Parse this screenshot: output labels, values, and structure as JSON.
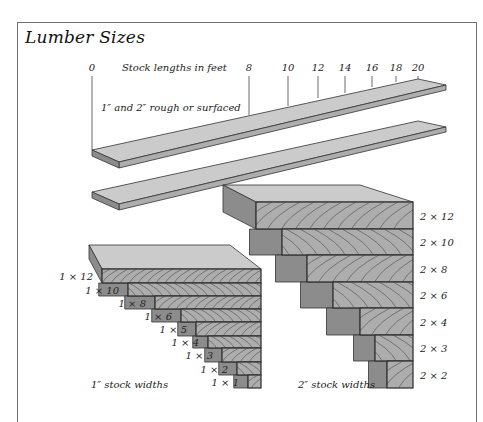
{
  "title": "Lumber Sizes",
  "lengths": {
    "heading": "Stock lengths in feet",
    "ticks": [
      {
        "label": "0",
        "x": 92,
        "y_end": 150
      },
      {
        "label": "8",
        "x": 249,
        "y_end": 115
      },
      {
        "label": "10",
        "x": 288,
        "y_end": 106
      },
      {
        "label": "12",
        "x": 318,
        "y_end": 98
      },
      {
        "label": "14",
        "x": 345,
        "y_end": 93
      },
      {
        "label": "16",
        "x": 372,
        "y_end": 87
      },
      {
        "label": "18",
        "x": 396,
        "y_end": 82
      },
      {
        "label": "20",
        "x": 418,
        "y_end": 79
      }
    ],
    "plank_caption": "1″ and 2″ rough or surfaced"
  },
  "one_inch": {
    "caption": "1″ stock widths",
    "boards": [
      {
        "label": "1 × 12",
        "x": 102,
        "y1": 269,
        "y2": 283
      },
      {
        "label": "1 × 10",
        "x": 128,
        "y1": 283,
        "y2": 296
      },
      {
        "label": "1 × 8",
        "x": 155,
        "y1": 296,
        "y2": 309
      },
      {
        "label": "1 × 6",
        "x": 181,
        "y1": 309,
        "y2": 322
      },
      {
        "label": "1 × 5",
        "x": 196,
        "y1": 322,
        "y2": 336
      },
      {
        "label": "1 × 4",
        "x": 208,
        "y1": 336,
        "y2": 348
      },
      {
        "label": "1 × 3",
        "x": 222,
        "y1": 348,
        "y2": 362
      },
      {
        "label": "1 × 2",
        "x": 237,
        "y1": 362,
        "y2": 375
      },
      {
        "label": "1 × 1",
        "x": 248,
        "y1": 375,
        "y2": 388
      }
    ]
  },
  "two_inch": {
    "caption": "2″ stock widths",
    "boards": [
      {
        "label": "2 × 12",
        "x": 256,
        "y1": 202,
        "y2": 229
      },
      {
        "label": "2 × 10",
        "x": 282,
        "y1": 229,
        "y2": 255
      },
      {
        "label": "2 × 8",
        "x": 307,
        "y1": 255,
        "y2": 282
      },
      {
        "label": "2 × 6",
        "x": 333,
        "y1": 282,
        "y2": 308
      },
      {
        "label": "2 × 4",
        "x": 360,
        "y1": 308,
        "y2": 335
      },
      {
        "label": "2 × 3",
        "x": 375,
        "y1": 335,
        "y2": 361
      },
      {
        "label": "2 × 2",
        "x": 387,
        "y1": 361,
        "y2": 388
      }
    ]
  },
  "colors": {
    "top": "#cbcbcb",
    "front": "#adadad",
    "side": "#8c8c8c",
    "edge": "#333333",
    "grain": "#4a4a4a"
  }
}
